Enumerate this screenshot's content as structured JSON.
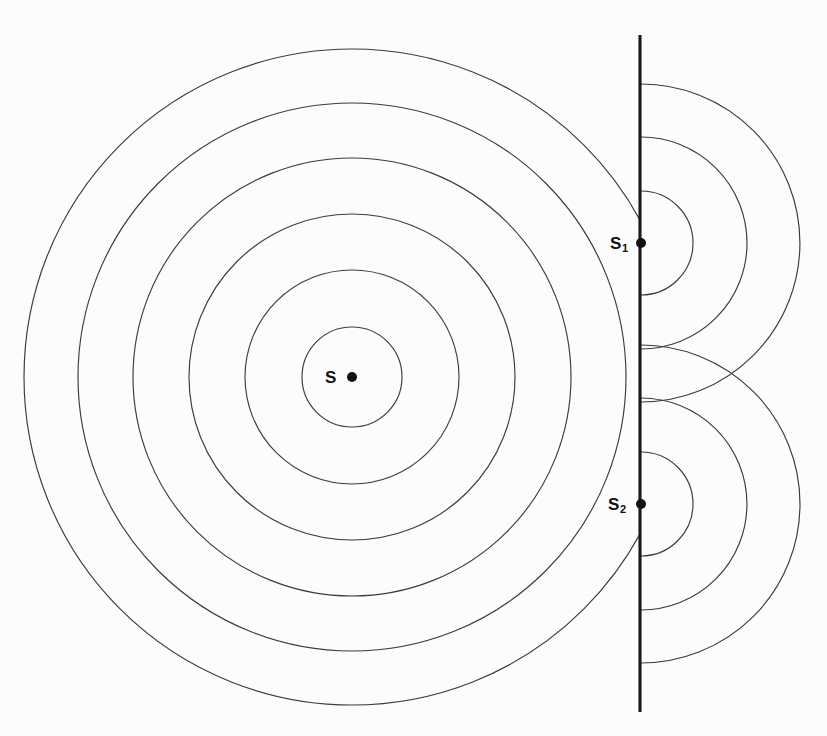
{
  "figure": {
    "width": 827,
    "height": 736,
    "background_color": "#fcfcfc",
    "stroke_color": "#3a3a44",
    "barrier_color": "#18181c",
    "dot_color": "#121216"
  },
  "labels": {
    "primary_source": "S",
    "slit_one_base": "S",
    "slit_one_subscript": "1",
    "slit_two_base": "S",
    "slit_two_subscript": "2"
  },
  "chart_data": {
    "type": "scatter",
    "xlabel": "",
    "ylabel": "",
    "xlim": [
      0,
      827
    ],
    "ylim": [
      0,
      736
    ],
    "grid": false,
    "legend": "none",
    "annotations": [
      {
        "text": "S",
        "x": 332,
        "y": 377
      },
      {
        "text": "S1",
        "x": 620,
        "y": 243
      },
      {
        "text": "S2",
        "x": 618,
        "y": 504
      }
    ],
    "series": [
      {
        "name": "primary-source-wavefronts",
        "kind": "concentric-circles",
        "center": {
          "x": 352,
          "y": 377
        },
        "radii": [
          50,
          107,
          163,
          219,
          274,
          328
        ],
        "clip": "left-of-barrier",
        "count": 6
      },
      {
        "name": "slit-one-wavefronts",
        "kind": "semicircles-right",
        "center": {
          "x": 641,
          "y": 243
        },
        "radii": [
          52,
          106,
          159
        ],
        "count": 3
      },
      {
        "name": "slit-two-wavefronts",
        "kind": "semicircles-right",
        "center": {
          "x": 641,
          "y": 504
        },
        "radii": [
          52,
          106,
          159
        ],
        "count": 3
      },
      {
        "name": "barrier",
        "kind": "vertical-line",
        "x": 640,
        "y_start": 35,
        "y_end": 712
      },
      {
        "name": "source-points",
        "kind": "points",
        "x": [
          352,
          641,
          641
        ],
        "y": [
          377,
          243,
          504
        ],
        "point_labels": [
          "S",
          "S1",
          "S2"
        ],
        "marker_radius": 5
      }
    ]
  }
}
